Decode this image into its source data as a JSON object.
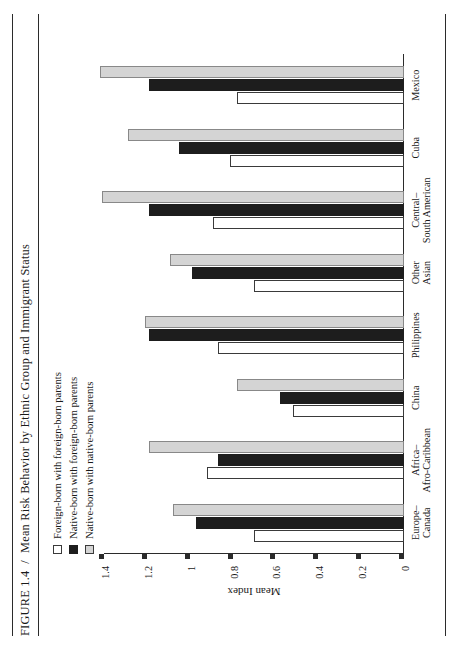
{
  "figure": {
    "number": "FIGURE 1.4",
    "separator": "/",
    "title": "Mean Risk Behavior by Ethnic Group and Immigrant Status"
  },
  "legend": {
    "position": "top-left",
    "items": [
      {
        "label": "Foreign-born with foreign-born parents",
        "swatch": "white",
        "color": "#ffffff"
      },
      {
        "label": "Native-born with foreign-born parents",
        "swatch": "black",
        "color": "#1d1d1d"
      },
      {
        "label": "Native-born with native-born parents",
        "swatch": "gray",
        "color": "#d4d4d4"
      }
    ]
  },
  "axes": {
    "y_title": "Mean Index",
    "y_ticks": [
      "0",
      "0.2",
      "0.4",
      "0.6",
      "0.8",
      "1",
      "1.2",
      "1.4"
    ],
    "y_min": 0,
    "y_max": 1.4
  },
  "chart_data": {
    "type": "bar",
    "title": "Mean Risk Behavior by Ethnic Group and Immigrant Status",
    "xlabel": "",
    "ylabel": "Mean Index",
    "ylim": [
      0,
      1.4
    ],
    "grid": false,
    "legend_position": "top-left",
    "categories": [
      "Europe–Canada",
      "Africa–Afro-Caribbean",
      "China",
      "Philippines",
      "Other Asian",
      "Central–South American",
      "Cuba",
      "Mexico"
    ],
    "category_lines": [
      [
        "Europe–",
        "Canada"
      ],
      [
        "Africa–",
        "Afro-Caribbean"
      ],
      [
        "China"
      ],
      [
        "Philippines"
      ],
      [
        "Other",
        "Asian"
      ],
      [
        "Central–",
        "South American"
      ],
      [
        "Cuba"
      ],
      [
        "Mexico"
      ]
    ],
    "series": [
      {
        "name": "Foreign-born with foreign-born parents",
        "color": "#ffffff",
        "values": [
          0.7,
          0.92,
          0.52,
          0.87,
          0.7,
          0.89,
          0.81,
          0.78
        ]
      },
      {
        "name": "Native-born with foreign-born parents",
        "color": "#1d1d1d",
        "values": [
          0.97,
          0.87,
          0.58,
          1.19,
          0.99,
          1.19,
          1.05,
          1.19
        ]
      },
      {
        "name": "Native-born with native-born parents",
        "color": "#d4d4d4",
        "values": [
          1.08,
          1.19,
          0.78,
          1.21,
          1.09,
          1.41,
          1.29,
          1.42
        ]
      }
    ]
  }
}
